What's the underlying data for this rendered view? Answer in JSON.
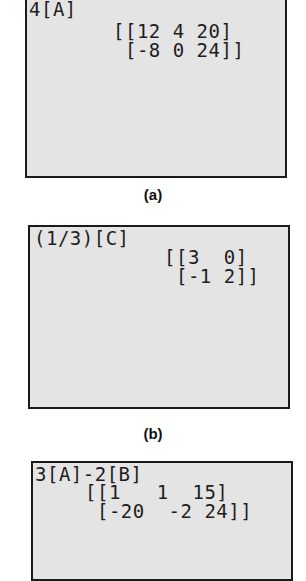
{
  "panels": [
    {
      "caption": "(a)",
      "expression": "4[A]",
      "result_rows": [
        "[[12 4 20]",
        " [-8 0 24]]"
      ]
    },
    {
      "caption": "(b)",
      "expression": "(1/3)[C]",
      "result_rows": [
        "[[3  0]",
        " [-1 2]]"
      ]
    },
    {
      "caption": "",
      "expression": "3[A]-2[B]",
      "result_rows": [
        "[[1   1  15]",
        " [-20  -2 24]]"
      ]
    }
  ]
}
